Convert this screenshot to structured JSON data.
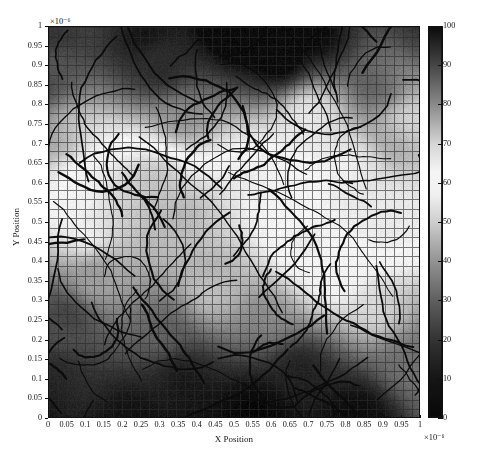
{
  "figure": {
    "domain": "chart",
    "background_color": "#ffffff",
    "axis_color": "#101010",
    "text_color": "#141414",
    "grid_color": "#2b2b2b",
    "fiber_color": "#0b0b0b"
  },
  "axes": {
    "x_title": "X Position",
    "y_title": "Y Position",
    "x_exponent": "×10⁻⁶",
    "y_exponent": "×10⁻⁶",
    "x_ticks": [
      "0",
      "0.05",
      "0.1",
      "0.15",
      "0.2",
      "0.25",
      "0.3",
      "0.35",
      "0.4",
      "0.45",
      "0.5",
      "0.55",
      "0.6",
      "0.65",
      "0.7",
      "0.75",
      "0.8",
      "0.85",
      "0.9",
      "0.95",
      "1"
    ],
    "y_ticks": [
      "0",
      "0.05",
      "0.1",
      "0.15",
      "0.2",
      "0.25",
      "0.3",
      "0.35",
      "0.4",
      "0.45",
      "0.5",
      "0.55",
      "0.6",
      "0.65",
      "0.7",
      "0.75",
      "0.8",
      "0.85",
      "0.9",
      "0.95",
      "1"
    ],
    "x_tick_values": [
      0,
      0.05,
      0.1,
      0.15,
      0.2,
      0.25,
      0.3,
      0.35,
      0.4,
      0.45,
      0.5,
      0.55,
      0.6,
      0.65,
      0.7,
      0.75,
      0.8,
      0.85,
      0.9,
      0.95,
      1
    ],
    "y_tick_values": [
      0,
      0.05,
      0.1,
      0.15,
      0.2,
      0.25,
      0.3,
      0.35,
      0.4,
      0.45,
      0.5,
      0.55,
      0.6,
      0.65,
      0.7,
      0.75,
      0.8,
      0.85,
      0.9,
      0.95,
      1
    ]
  },
  "colorbar": {
    "min": 0,
    "max": 100,
    "ticks": [
      0,
      10,
      20,
      30,
      40,
      50,
      60,
      70,
      80,
      90,
      100
    ],
    "tick_labels": [
      "0",
      "10",
      "20",
      "30",
      "40",
      "50",
      "60",
      "70",
      "80",
      "90",
      "100"
    ],
    "orientation": "vertical",
    "position": "right",
    "note": "grayscale: dark at both extremes, brightest near the middle of the range"
  },
  "chart_data": {
    "type": "heatmap",
    "title": "",
    "xlabel": "X Position",
    "ylabel": "Y Position",
    "xlim": [
      0,
      1
    ],
    "ylim": [
      0,
      1
    ],
    "zlim": [
      0,
      100
    ],
    "grid": true,
    "grid_cells": [
      41,
      41
    ],
    "colormap": "gray-dual-ended",
    "colormap_stops": [
      {
        "value": 0,
        "gray": 8
      },
      {
        "value": 10,
        "gray": 22
      },
      {
        "value": 20,
        "gray": 52
      },
      {
        "value": 30,
        "gray": 96
      },
      {
        "value": 40,
        "gray": 148
      },
      {
        "value": 50,
        "gray": 206
      },
      {
        "value": 57,
        "gray": 240
      },
      {
        "value": 63,
        "gray": 245
      },
      {
        "value": 70,
        "gray": 214
      },
      {
        "value": 80,
        "gray": 140
      },
      {
        "value": 90,
        "gray": 72
      },
      {
        "value": 100,
        "gray": 12
      }
    ],
    "field_description": "smooth scalar field over the unit square, highest values along the top edge, lowest along the bottom and lower-left, bright mid-range band across the centre",
    "field_control_points": [
      {
        "x": 0.0,
        "y": 1.0,
        "v": 97
      },
      {
        "x": 0.25,
        "y": 1.0,
        "v": 99
      },
      {
        "x": 0.5,
        "y": 1.0,
        "v": 98
      },
      {
        "x": 0.75,
        "y": 1.0,
        "v": 99
      },
      {
        "x": 1.0,
        "y": 1.0,
        "v": 96
      },
      {
        "x": 0.0,
        "y": 0.88,
        "v": 90
      },
      {
        "x": 0.3,
        "y": 0.9,
        "v": 93
      },
      {
        "x": 0.62,
        "y": 0.92,
        "v": 95
      },
      {
        "x": 0.9,
        "y": 0.86,
        "v": 92
      },
      {
        "x": 0.05,
        "y": 0.72,
        "v": 74
      },
      {
        "x": 0.35,
        "y": 0.76,
        "v": 80
      },
      {
        "x": 0.7,
        "y": 0.78,
        "v": 64
      },
      {
        "x": 0.95,
        "y": 0.74,
        "v": 78
      },
      {
        "x": 0.08,
        "y": 0.6,
        "v": 60
      },
      {
        "x": 0.3,
        "y": 0.62,
        "v": 58
      },
      {
        "x": 0.55,
        "y": 0.58,
        "v": 57
      },
      {
        "x": 0.8,
        "y": 0.62,
        "v": 62
      },
      {
        "x": 0.1,
        "y": 0.48,
        "v": 56
      },
      {
        "x": 0.4,
        "y": 0.5,
        "v": 55
      },
      {
        "x": 0.68,
        "y": 0.46,
        "v": 58
      },
      {
        "x": 0.92,
        "y": 0.5,
        "v": 60
      },
      {
        "x": 0.12,
        "y": 0.36,
        "v": 38
      },
      {
        "x": 0.45,
        "y": 0.34,
        "v": 50
      },
      {
        "x": 0.75,
        "y": 0.36,
        "v": 52
      },
      {
        "x": 0.05,
        "y": 0.25,
        "v": 18
      },
      {
        "x": 0.3,
        "y": 0.22,
        "v": 26
      },
      {
        "x": 0.6,
        "y": 0.26,
        "v": 42
      },
      {
        "x": 0.88,
        "y": 0.28,
        "v": 46
      },
      {
        "x": 0.02,
        "y": 0.1,
        "v": 8
      },
      {
        "x": 0.35,
        "y": 0.1,
        "v": 12
      },
      {
        "x": 0.68,
        "y": 0.12,
        "v": 22
      },
      {
        "x": 0.95,
        "y": 0.14,
        "v": 30
      },
      {
        "x": 0.2,
        "y": 0.0,
        "v": 4
      },
      {
        "x": 0.55,
        "y": 0.0,
        "v": 5
      },
      {
        "x": 0.85,
        "y": 0.0,
        "v": 8
      }
    ],
    "overlay": {
      "type": "fiber-segments",
      "count": 104,
      "color": "#0b0b0b",
      "description": "short dark curved filament/fibre traces scattered across the domain"
    }
  },
  "caption": {
    "ghost_text": ""
  }
}
